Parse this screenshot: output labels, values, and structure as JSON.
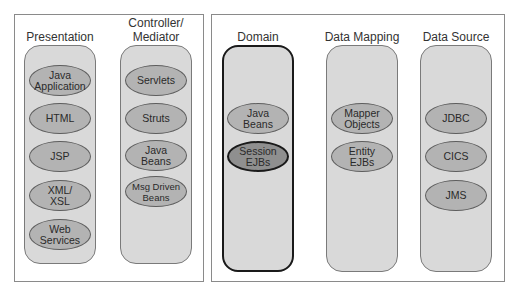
{
  "diagram": {
    "groups": [
      {
        "id": "client-tier",
        "columns": [
          {
            "title": "Presentation",
            "items": [
              "Java\nApplication",
              "HTML",
              "JSP",
              "XML/\nXSL",
              "Web\nServices"
            ]
          },
          {
            "title": "Controller/\nMediator",
            "items": [
              "Servlets",
              "Struts",
              "Java\nBeans",
              "Msg Driven\nBeans"
            ]
          }
        ]
      },
      {
        "id": "server-tier",
        "columns": [
          {
            "title": "Domain",
            "highlighted": true,
            "items": [
              "Java\nBeans",
              "Session\nEJBs"
            ],
            "highlighted_item": "Session\nEJBs"
          },
          {
            "title": "Data Mapping",
            "items": [
              "Mapper\nObjects",
              "Entity\nEJBs"
            ]
          },
          {
            "title": "Data Source",
            "items": [
              "JDBC",
              "CICS",
              "JMS"
            ]
          }
        ]
      }
    ],
    "colors": {
      "frame_border": "#8a8a8a",
      "column_fill": "#d9d9d9",
      "oval_fill": "#b3b3b3",
      "oval_highlight_fill": "#8f8f8f",
      "highlight_border": "#1a1a1a"
    }
  }
}
